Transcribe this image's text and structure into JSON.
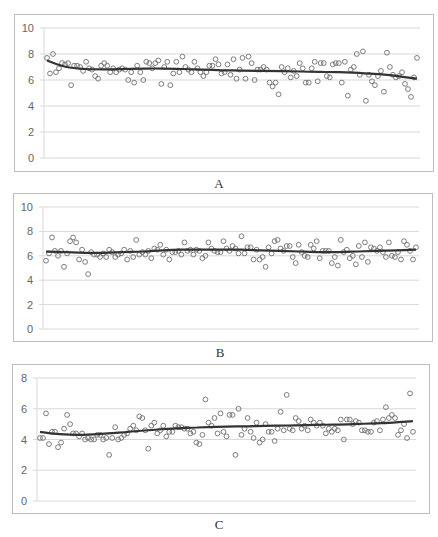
{
  "figure": {
    "caption_visible_fragment": ""
  },
  "chart_data": [
    {
      "type": "scatter",
      "panel": "A",
      "title": "",
      "xlabel": "A",
      "ylabel": "",
      "ylim": [
        0,
        10
      ],
      "yticks": [
        0,
        2,
        4,
        6,
        8,
        10
      ],
      "grid": true,
      "legend": null,
      "trendline": "polynomial, starting ~7.5 dropping to ~6.8, slowly decreasing to ~6.1 at end",
      "trend": [
        7.5,
        7.0,
        6.85,
        6.82,
        6.85,
        6.88,
        6.88,
        6.85,
        6.8,
        6.75,
        6.72,
        6.7,
        6.68,
        6.65,
        6.62,
        6.6,
        6.55,
        6.45,
        6.3,
        6.1
      ],
      "values": [
        7.7,
        6.5,
        8.0,
        6.6,
        6.9,
        7.3,
        7.2,
        7.3,
        5.6,
        7.1,
        7.1,
        7.0,
        6.7,
        7.4,
        6.9,
        6.8,
        6.3,
        6.1,
        7.1,
        7.3,
        7.1,
        6.6,
        6.9,
        6.6,
        6.8,
        6.9,
        6.8,
        6.0,
        6.6,
        5.8,
        7.1,
        6.6,
        6.0,
        7.4,
        7.3,
        6.9,
        7.3,
        7.5,
        5.7,
        7.0,
        7.4,
        5.6,
        6.5,
        7.4,
        6.6,
        7.8,
        7.0,
        6.8,
        6.6,
        7.4,
        6.9,
        6.6,
        6.3,
        6.6,
        7.1,
        7.1,
        7.6,
        7.2,
        6.5,
        6.6,
        7.2,
        6.4,
        7.6,
        6.1,
        6.8,
        7.7,
        6.1,
        7.8,
        7.3,
        6.0,
        6.8,
        6.8,
        7.0,
        6.8,
        5.8,
        5.5,
        5.8,
        4.9,
        7.0,
        6.6,
        6.9,
        6.2,
        6.7,
        6.3,
        7.3,
        6.9,
        5.8,
        5.8,
        6.9,
        7.4,
        5.9,
        7.3,
        7.3,
        6.3,
        6.2,
        7.2,
        7.3,
        7.3,
        5.8,
        7.4,
        4.8,
        6.8,
        7.0,
        8.0,
        6.4,
        8.2,
        4.4,
        6.4,
        5.9,
        5.6,
        6.3,
        6.7,
        5.1,
        8.1,
        7.0,
        6.4,
        6.2,
        6.3,
        6.6,
        5.7,
        5.3,
        4.7,
        6.2,
        7.7
      ]
    },
    {
      "type": "scatter",
      "panel": "B",
      "title": "",
      "xlabel": "B",
      "ylabel": "",
      "ylim": [
        0,
        10
      ],
      "yticks": [
        0,
        2,
        4,
        6,
        8,
        10
      ],
      "grid": true,
      "legend": null,
      "trendline": "nearly flat ~6.3, slight wave up to ~6.5",
      "trend": [
        6.35,
        6.3,
        6.25,
        6.25,
        6.3,
        6.35,
        6.45,
        6.5,
        6.5,
        6.5,
        6.5,
        6.45,
        6.4,
        6.35,
        6.3,
        6.3,
        6.35,
        6.4,
        6.45,
        6.5
      ],
      "values": [
        5.6,
        6.2,
        7.5,
        6.4,
        6.0,
        6.4,
        5.1,
        6.2,
        7.2,
        7.5,
        7.1,
        5.7,
        6.5,
        5.5,
        4.5,
        6.3,
        6.1,
        6.1,
        5.9,
        6.2,
        5.9,
        6.5,
        6.3,
        5.9,
        6.1,
        6.2,
        6.5,
        5.7,
        6.4,
        5.9,
        7.3,
        6.1,
        6.3,
        6.1,
        6.4,
        5.8,
        6.6,
        6.5,
        6.9,
        6.1,
        6.5,
        5.7,
        6.3,
        6.3,
        6.4,
        6.1,
        7.1,
        6.4,
        6.5,
        6.1,
        6.5,
        6.4,
        5.8,
        6.0,
        7.1,
        6.6,
        6.4,
        6.3,
        6.3,
        7.2,
        6.6,
        6.4,
        6.8,
        6.6,
        6.2,
        7.6,
        6.2,
        6.7,
        6.7,
        5.7,
        6.5,
        5.7,
        5.9,
        5.1,
        6.7,
        6.2,
        7.2,
        7.3,
        6.6,
        6.4,
        6.8,
        6.8,
        5.9,
        5.4,
        6.9,
        6.3,
        6.0,
        5.9,
        6.9,
        6.6,
        7.2,
        5.8,
        6.4,
        6.4,
        6.4,
        5.4,
        5.9,
        5.2,
        7.3,
        6.3,
        6.5,
        5.8,
        6.0,
        5.3,
        6.8,
        5.9,
        7.1,
        5.5,
        6.7,
        6.6,
        6.4,
        6.7,
        6.3,
        5.9,
        7.1,
        6.0,
        5.9,
        6.3,
        5.7,
        7.2,
        6.9,
        6.4,
        5.7,
        6.7
      ]
    },
    {
      "type": "scatter",
      "panel": "C",
      "title": "",
      "xlabel": "C",
      "ylabel": "",
      "ylim": [
        0,
        8
      ],
      "yticks": [
        0,
        2,
        4,
        6,
        8
      ],
      "grid": true,
      "legend": null,
      "trendline": "gently rising from ~4.5 to ~5.2 with a slight dip near start",
      "trend": [
        4.5,
        4.35,
        4.3,
        4.35,
        4.45,
        4.55,
        4.65,
        4.72,
        4.78,
        4.82,
        4.85,
        4.87,
        4.9,
        4.92,
        4.95,
        4.97,
        5.0,
        5.05,
        5.1,
        5.2
      ],
      "values": [
        4.1,
        4.1,
        5.7,
        3.7,
        4.5,
        4.5,
        3.5,
        3.8,
        4.7,
        5.6,
        5.0,
        4.4,
        4.4,
        4.2,
        4.4,
        4.0,
        4.1,
        4.0,
        4.0,
        4.3,
        4.3,
        4.0,
        4.1,
        3.0,
        4.1,
        4.8,
        4.0,
        4.1,
        4.3,
        4.4,
        4.7,
        4.9,
        4.6,
        5.5,
        5.4,
        4.6,
        3.4,
        4.9,
        5.1,
        4.4,
        4.6,
        4.9,
        4.2,
        4.5,
        4.5,
        4.9,
        4.8,
        4.8,
        4.7,
        4.7,
        4.4,
        4.5,
        3.8,
        3.7,
        4.3,
        6.6,
        5.1,
        4.9,
        5.4,
        4.4,
        5.7,
        4.5,
        4.2,
        5.6,
        5.6,
        3.0,
        6.0,
        4.3,
        4.7,
        5.4,
        4.5,
        4.1,
        5.1,
        3.8,
        4.0,
        5.0,
        4.5,
        4.5,
        3.9,
        4.7,
        5.8,
        4.6,
        6.9,
        4.7,
        4.6,
        5.4,
        5.2,
        4.7,
        4.9,
        4.6,
        5.3,
        5.1,
        4.9,
        5.1,
        4.9,
        4.4,
        4.7,
        4.5,
        4.7,
        4.6,
        5.3,
        4.0,
        5.3,
        5.3,
        5.0,
        5.2,
        5.1,
        4.6,
        4.6,
        4.5,
        4.5,
        5.1,
        5.2,
        4.6,
        5.3,
        6.1,
        5.4,
        5.6,
        5.4,
        4.3,
        4.6,
        5.0,
        4.1,
        7.0,
        4.5
      ]
    }
  ],
  "panels": [
    {
      "label": "A",
      "yticks": [
        "0",
        "2",
        "4",
        "6",
        "8",
        "10"
      ]
    },
    {
      "label": "B",
      "yticks": [
        "0",
        "2",
        "4",
        "6",
        "8",
        "10"
      ]
    },
    {
      "label": "C",
      "yticks": [
        "0",
        "2",
        "4",
        "6",
        "8"
      ]
    }
  ],
  "colors": {
    "marker_stroke": "#6e6e6e",
    "trendline": "#333333",
    "gridline": "#d9d9d9",
    "border": "#bdbdbd",
    "tick_text": "#666666"
  }
}
